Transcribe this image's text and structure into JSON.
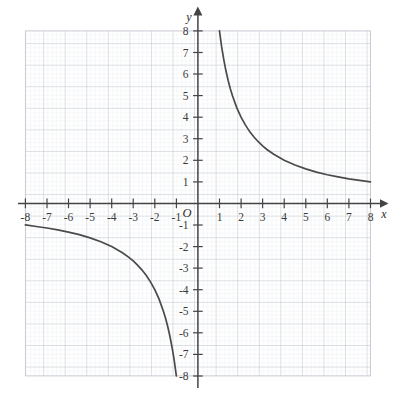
{
  "figure": {
    "title": "",
    "background_color": "#ffffff"
  },
  "axes": {
    "x_axis_label": "x",
    "y_axis_label": "y",
    "origin_label": "O",
    "x_tick_labels": [
      "-8",
      "-7",
      "-6",
      "-5",
      "-4",
      "-3",
      "-2",
      "-1",
      "1",
      "2",
      "3",
      "4",
      "5",
      "6",
      "7",
      "8"
    ],
    "y_tick_labels": [
      "8",
      "7",
      "6",
      "5",
      "4",
      "3",
      "2",
      "1",
      "-1",
      "-2",
      "-3",
      "-4",
      "-5",
      "-6",
      "-7",
      "-8"
    ],
    "axis_color": "#444444",
    "grid_major_color": "#bfc2cc",
    "grid_minor_color": "#e4e6ec"
  },
  "chart_data": {
    "type": "line",
    "title": "",
    "xlabel": "x",
    "ylabel": "y",
    "xlim": [
      -8,
      8
    ],
    "ylim": [
      -8,
      8
    ],
    "grid": true,
    "grid_major_step": 1,
    "grid_minor_step": 0.2,
    "legend": "none",
    "xticks": [
      -8,
      -7,
      -6,
      -5,
      -4,
      -3,
      -2,
      -1,
      1,
      2,
      3,
      4,
      5,
      6,
      7,
      8
    ],
    "yticks": [
      8,
      7,
      6,
      5,
      4,
      3,
      2,
      1,
      -1,
      -2,
      -3,
      -4,
      -5,
      -6,
      -7,
      -8
    ],
    "series": [
      {
        "name": "y = 8/x (branch x > 0)",
        "equation": "y = 8/x",
        "color": "#4a4a4a",
        "x": [
          1.0,
          1.1,
          1.2,
          1.3,
          1.4,
          1.5,
          1.6,
          1.8,
          2.0,
          2.2,
          2.4,
          2.6,
          2.8,
          3.0,
          3.2,
          3.5,
          4.0,
          4.5,
          5.0,
          5.5,
          6.0,
          6.5,
          7.0,
          7.5,
          8.0
        ],
        "values": [
          8.0,
          7.27,
          6.67,
          6.15,
          5.71,
          5.33,
          5.0,
          4.44,
          4.0,
          3.64,
          3.33,
          3.08,
          2.86,
          2.67,
          2.5,
          2.29,
          2.0,
          1.78,
          1.6,
          1.45,
          1.33,
          1.23,
          1.14,
          1.07,
          1.0
        ]
      },
      {
        "name": "y = 8/x (branch x < 0)",
        "equation": "y = 8/x",
        "color": "#4a4a4a",
        "x": [
          -8.0,
          -7.5,
          -7.0,
          -6.5,
          -6.0,
          -5.5,
          -5.0,
          -4.5,
          -4.0,
          -3.5,
          -3.2,
          -3.0,
          -2.8,
          -2.6,
          -2.4,
          -2.2,
          -2.0,
          -1.8,
          -1.6,
          -1.5,
          -1.4,
          -1.3,
          -1.2,
          -1.1,
          -1.0
        ],
        "values": [
          -1.0,
          -1.07,
          -1.14,
          -1.23,
          -1.33,
          -1.45,
          -1.6,
          -1.78,
          -2.0,
          -2.29,
          -2.5,
          -2.67,
          -2.86,
          -3.08,
          -3.33,
          -3.64,
          -4.0,
          -4.44,
          -5.0,
          -5.33,
          -5.71,
          -6.15,
          -6.67,
          -7.27,
          -8.0
        ]
      }
    ],
    "annotations": []
  }
}
